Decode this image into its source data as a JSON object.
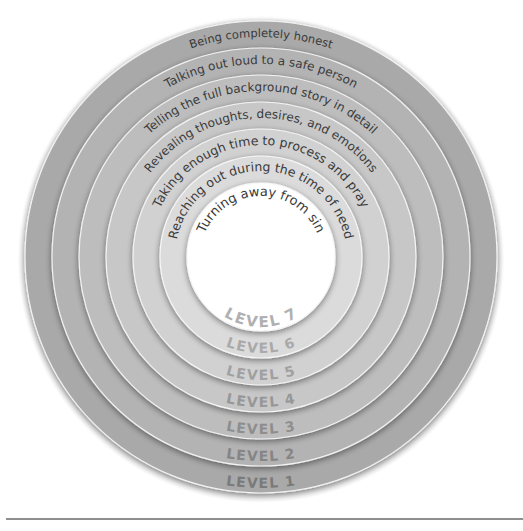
{
  "diagram": {
    "center": {
      "x": 261,
      "y": 257
    },
    "levels": [
      {
        "level_label": "LEVEL 1",
        "description": "Being completely honest",
        "outer_radius": 236,
        "fill": "#a9a9a9",
        "level_color": "#7a7a7a"
      },
      {
        "level_label": "LEVEL 2",
        "description": "Talking out loud to a safe person",
        "outer_radius": 209,
        "fill": "#b4b4b4",
        "level_color": "#858585"
      },
      {
        "level_label": "LEVEL 3",
        "description": "Telling the full background story in detail",
        "outer_radius": 182,
        "fill": "#bebebe",
        "level_color": "#8e8e8e"
      },
      {
        "level_label": "LEVEL 4",
        "description": "Revealing thoughts, desires, and emotions",
        "outer_radius": 155,
        "fill": "#c8c8c8",
        "level_color": "#979797"
      },
      {
        "level_label": "LEVEL 5",
        "description": "Taking enough time to process and pray",
        "outer_radius": 128,
        "fill": "#d2d2d2",
        "level_color": "#a0a0a0"
      },
      {
        "level_label": "LEVEL 6",
        "description": "Reaching out during the time of need",
        "outer_radius": 101,
        "fill": "#dcdcdc",
        "level_color": "#a9a9a9"
      },
      {
        "level_label": "LEVEL 7",
        "description": "Turning away from sin",
        "outer_radius": 74,
        "fill": "#ffffff",
        "level_color": "#b0b0b0"
      }
    ]
  },
  "labels": {
    "l1": "LEVEL 1",
    "l2": "LEVEL 2",
    "l3": "LEVEL 3",
    "l4": "LEVEL 4",
    "l5": "LEVEL 5",
    "l6": "LEVEL 6",
    "l7": "LEVEL 7",
    "d1": "Being completely honest",
    "d2": "Talking out loud to a safe person",
    "d3": "Telling the full background story in detail",
    "d4": "Revealing thoughts, desires, and emotions",
    "d5": "Taking enough time to process and pray",
    "d6": "Reaching out during the time of need",
    "d7": "Turning away from sin"
  }
}
